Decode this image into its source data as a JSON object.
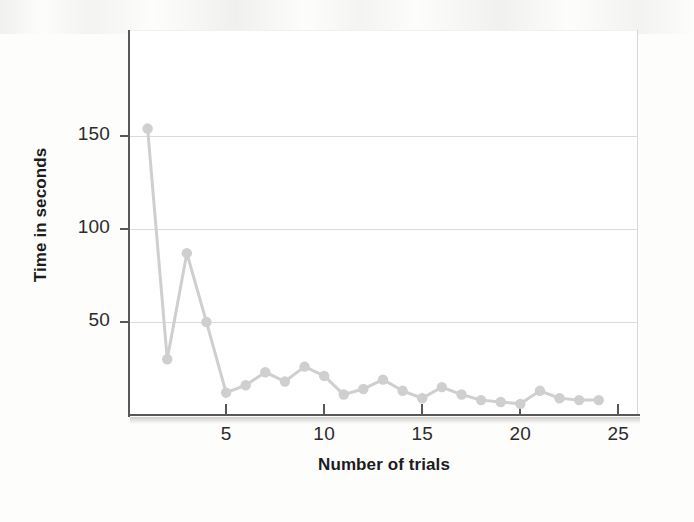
{
  "figure": {
    "axis_color": "#58585a",
    "series_color": "#cfcfcf",
    "grid_color": "#dcdbd9",
    "background": "#ffffff"
  },
  "chart_data": {
    "type": "line",
    "title": "",
    "subtitle": "",
    "xlabel": "Number of trials",
    "ylabel": "Time in seconds",
    "xlim": [
      0,
      26
    ],
    "ylim": [
      0,
      198
    ],
    "xticks": [
      5,
      10,
      15,
      20,
      25
    ],
    "xtick_labels": [
      "5",
      "10",
      "15",
      "20",
      "25"
    ],
    "yticks": [
      50,
      100,
      150
    ],
    "ytick_labels": [
      "50",
      "100",
      "150"
    ],
    "grid": true,
    "grid_axis": "y",
    "legend": false,
    "legend_position": "none",
    "marker": "circle",
    "series": [
      {
        "name": "Time per trial",
        "color": "#cfcfcf",
        "x": [
          1,
          2,
          3,
          4,
          5,
          6,
          7,
          8,
          9,
          10,
          11,
          12,
          13,
          14,
          15,
          16,
          17,
          18,
          19,
          20,
          21,
          22,
          23,
          24
        ],
        "values": [
          154,
          30,
          87,
          50,
          12,
          16,
          23,
          18,
          26,
          21,
          11,
          14,
          19,
          13,
          9,
          15,
          11,
          8,
          7,
          6,
          13,
          9,
          8,
          8
        ]
      }
    ]
  }
}
